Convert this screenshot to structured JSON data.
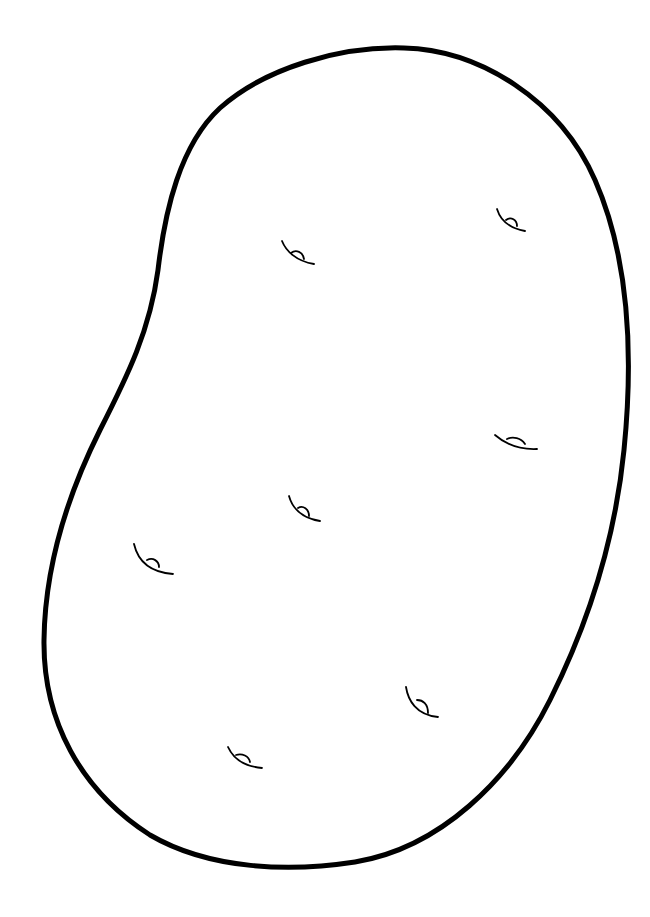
{
  "image": {
    "subject": "potato coloring page outline",
    "background_color": "#ffffff",
    "outline_color": "#000000",
    "outline_width": 5,
    "eye_stroke_width": 1.6,
    "eyes": [
      {
        "name": "eye-upper-left",
        "x": 298,
        "y": 253
      },
      {
        "name": "eye-upper-right",
        "x": 511,
        "y": 221
      },
      {
        "name": "eye-mid-right",
        "x": 515,
        "y": 442
      },
      {
        "name": "eye-center",
        "x": 303,
        "y": 510
      },
      {
        "name": "eye-left",
        "x": 152,
        "y": 562
      },
      {
        "name": "eye-lower-right",
        "x": 422,
        "y": 705
      },
      {
        "name": "eye-bottom",
        "x": 243,
        "y": 758
      }
    ]
  }
}
